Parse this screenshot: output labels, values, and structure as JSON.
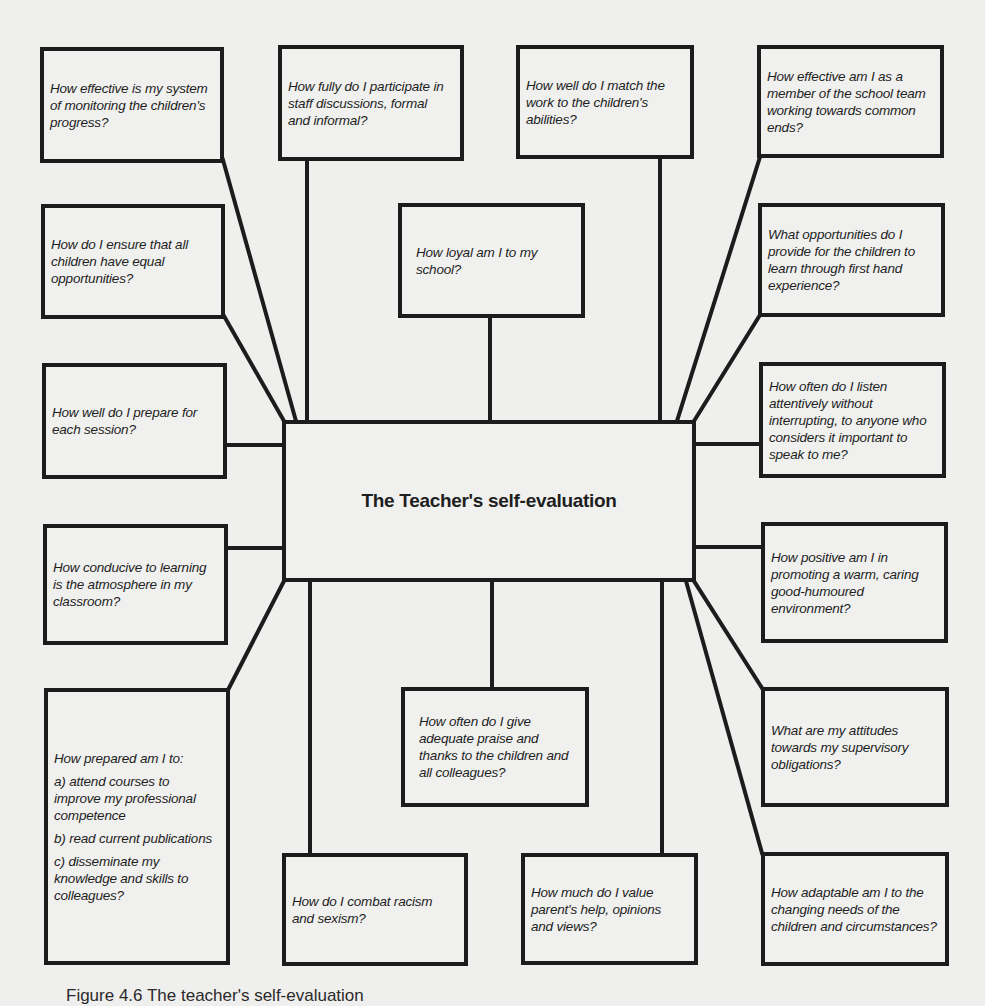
{
  "diagram": {
    "title": "The Teacher's self-evaluation",
    "boxes": {
      "monitoring": "How effective is my system of monitoring the children's progress?",
      "participate": "How fully do I participate in staff discussions, formal and informal?",
      "match_work": "How well do I match the work to the children's abilities?",
      "team_member": "How effective am I as a member of the school team working towards common ends?",
      "equal_opps": "How do I ensure that all children have equal opportunities?",
      "loyal": "How loyal am I to my school?",
      "first_hand": "What opportunities do I provide for the children to learn through first hand experience?",
      "prepare": "How well do I prepare for each session?",
      "listen": "How often do I listen attentively without interrupting, to anyone who considers it important to speak to me?",
      "atmosphere": "How conducive to learning is the atmosphere in my classroom?",
      "positive": "How positive am I in promoting a warm, caring good-humoured environment?",
      "prepared": {
        "intro": "How prepared am I to:",
        "a": "a) attend courses to improve my professional competence",
        "b": "b) read current publications",
        "c": "c) disseminate my knowledge and skills to colleagues?"
      },
      "praise": "How often do I give adequate praise and thanks to the children and all colleagues?",
      "supervisory": "What are my attitudes towards my supervisory obligations?",
      "racism": "How do I combat racism and sexism?",
      "parents": "How much do I value parent's help, opinions and views?",
      "adaptable": "How adaptable am I to the changing needs of the children and circumstances?"
    }
  },
  "caption": "Figure 4.6  The teacher's self-evaluation"
}
